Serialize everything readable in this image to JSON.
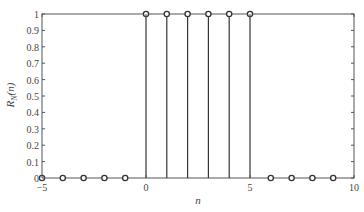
{
  "chart_data": {
    "type": "stem",
    "title": "",
    "xlabel": "n",
    "ylabel": "R_N(n)",
    "ylabel_main": "R",
    "ylabel_sub": "N",
    "ylabel_arg": "(n)",
    "xlim": [
      -5,
      10
    ],
    "ylim": [
      0,
      1
    ],
    "grid": false,
    "legend": null,
    "x_ticks": [
      -5,
      0,
      5,
      10
    ],
    "x_tick_labels": [
      "−5",
      "0",
      "5",
      "10"
    ],
    "y_ticks": [
      0,
      0.1,
      0.2,
      0.3,
      0.4,
      0.5,
      0.6,
      0.7,
      0.8,
      0.9,
      1
    ],
    "y_tick_labels": [
      "0",
      "0.1",
      "0.2",
      "0.3",
      "0.4",
      "0.5",
      "0.6",
      "0.7",
      "0.8",
      "0.9",
      "1"
    ],
    "x": [
      -5,
      -4,
      -3,
      -2,
      -1,
      0,
      1,
      2,
      3,
      4,
      5,
      6,
      7,
      8,
      9
    ],
    "values": [
      0,
      0,
      0,
      0,
      0,
      1,
      1,
      1,
      1,
      1,
      1,
      0,
      0,
      0,
      0
    ],
    "marker": "open-circle"
  },
  "colors": {
    "axis": "#555555",
    "stem": "#333333",
    "marker": "#333333",
    "text": "#444444"
  }
}
